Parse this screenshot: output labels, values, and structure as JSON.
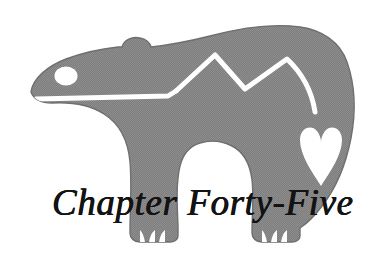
{
  "illustration": {
    "subject": "bear-silhouette",
    "style": "halftone-dithered-gray-silhouette",
    "colors": {
      "background": "#ffffff",
      "body_fill": "#7f7f7f",
      "body_fill_light": "#9a9a9a",
      "body_edge": "#6e6e6e",
      "highlight": "#ffffff",
      "text": "#131313"
    },
    "elements": [
      {
        "name": "bear-body",
        "description": "large gray bear silhouette facing left"
      },
      {
        "name": "bear-ear",
        "description": "small rounded ear bump on top of head"
      },
      {
        "name": "bear-eye",
        "description": "white circular eye"
      },
      {
        "name": "bear-mouth-line",
        "description": "white horizontal mouth stripe"
      },
      {
        "name": "mountain-zigzag-line",
        "description": "white zigzag mountain line along the back"
      },
      {
        "name": "heart-shape",
        "description": "white heart on the hindquarter"
      },
      {
        "name": "front-paw",
        "description": "front paw with three claws"
      },
      {
        "name": "rear-paw",
        "description": "rear paw with three claws"
      }
    ]
  },
  "caption": {
    "title": "Chapter Forty-Five"
  }
}
